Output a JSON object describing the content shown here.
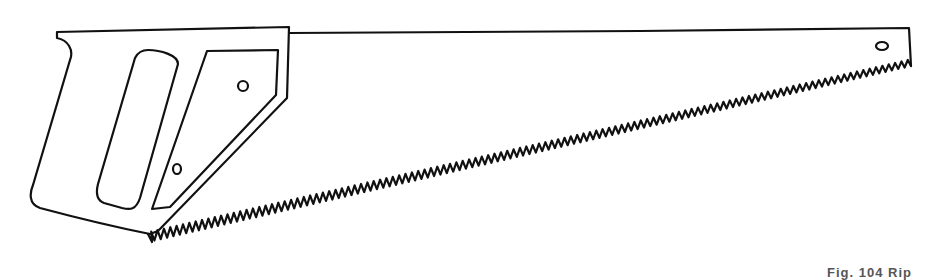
{
  "figure": {
    "caption": "Fig. 104 Rip",
    "parts": [
      "handle",
      "blade",
      "teeth",
      "rivets",
      "blade-hole"
    ]
  }
}
